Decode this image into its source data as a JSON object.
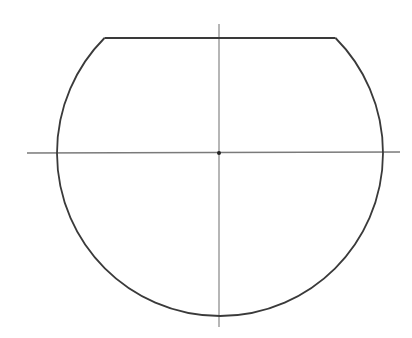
{
  "diagram": {
    "type": "truncated-circle",
    "shape": {
      "radius_units": 163,
      "chord_offset_above_center_units": 115
    },
    "colors": {
      "background": "#ffffff",
      "outline": "#3a3a3a",
      "axis": "#7a7a7a",
      "center_point": "#222222"
    },
    "elements": [
      {
        "name": "truncated-circle-outline",
        "kind": "outline"
      },
      {
        "name": "top-chord",
        "kind": "chord"
      },
      {
        "name": "horizontal-centerline",
        "kind": "axis"
      },
      {
        "name": "vertical-centerline",
        "kind": "axis"
      },
      {
        "name": "center-point",
        "kind": "point"
      }
    ]
  }
}
